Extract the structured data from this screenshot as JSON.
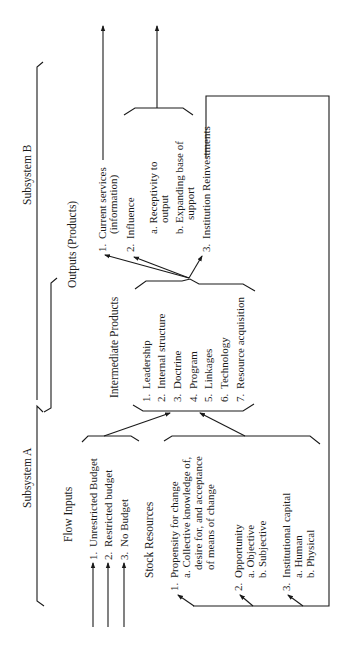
{
  "subsystems": {
    "b": "Subsystem B",
    "a": "Subsystem A"
  },
  "outputs": {
    "title": "Outputs (Products)",
    "items": [
      {
        "num": "1.",
        "lines": [
          "Current services",
          "(information)"
        ]
      },
      {
        "num": "2.",
        "lines": [
          "Influence"
        ]
      },
      {
        "num": "",
        "lines": [
          "a. Receptivity to",
          "output"
        ]
      },
      {
        "num": "",
        "lines": [
          "b. Expanding base of",
          "support"
        ]
      },
      {
        "num": "3.",
        "lines": [
          "Institution Reinvestments"
        ]
      }
    ]
  },
  "intermediate": {
    "title": "Intermediate Products",
    "items": [
      {
        "num": "1.",
        "label": "Leadership"
      },
      {
        "num": "2.",
        "label": "Internal structure"
      },
      {
        "num": "3.",
        "label": "Doctrine"
      },
      {
        "num": "4.",
        "label": "Program"
      },
      {
        "num": "5.",
        "label": "Linkages"
      },
      {
        "num": "6.",
        "label": "Technology"
      },
      {
        "num": "7.",
        "label": "Resource acquisition"
      }
    ]
  },
  "flow_inputs": {
    "title": "Flow Inputs",
    "items": [
      {
        "num": "1.",
        "label": "Unrestricted Budget"
      },
      {
        "num": "2.",
        "label": "Restricted budget"
      },
      {
        "num": "3.",
        "label": "No Budget"
      }
    ]
  },
  "stock_resources": {
    "title": "Stock Resources",
    "items": [
      {
        "num": "1.",
        "lines": [
          "Propensity for change",
          "a. Collective knowledge of,",
          "desire for, and acceptance",
          "of means of change"
        ]
      },
      {
        "num": "2.",
        "lines": [
          "Opportunity",
          "a. Objective",
          "b. Subjective"
        ]
      },
      {
        "num": "3.",
        "lines": [
          "Institutional capital",
          "a. Human",
          "b. Physical"
        ]
      }
    ]
  }
}
